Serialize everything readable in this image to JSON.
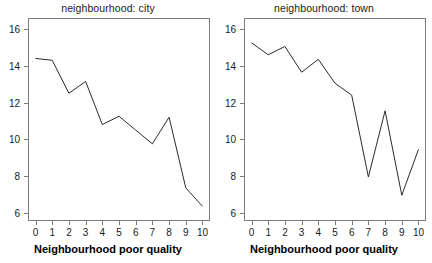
{
  "chart_data": [
    {
      "type": "line",
      "title": "neighbourhood: city",
      "xlabel": "Neighbourhood poor quality",
      "ylabel": "",
      "x": [
        0,
        1,
        2,
        3,
        4,
        5,
        6,
        7,
        8,
        9,
        10
      ],
      "xticklabels": [
        "0",
        "1",
        "2",
        "3",
        "4",
        "5",
        "6",
        "7",
        "8",
        "9",
        "10"
      ],
      "yticks": [
        6,
        8,
        10,
        12,
        14,
        16
      ],
      "yticklabels": [
        "6",
        "8",
        "10",
        "12",
        "14",
        "16"
      ],
      "values": [
        14.4,
        14.3,
        12.5,
        13.15,
        10.8,
        11.25,
        10.5,
        9.75,
        11.2,
        7.35,
        6.35
      ],
      "xlim": [
        -0.45,
        10.45
      ],
      "ylim": [
        5.55,
        16.6
      ],
      "grid": false,
      "legend": "none",
      "line_color": "#2b2b2b"
    },
    {
      "type": "line",
      "title": "neighbourhood: town",
      "xlabel": "Neighbourhood poor quality",
      "ylabel": "",
      "x": [
        0,
        1,
        2,
        3,
        4,
        5,
        6,
        7,
        8,
        9,
        10
      ],
      "xticklabels": [
        "0",
        "1",
        "2",
        "3",
        "4",
        "5",
        "6",
        "7",
        "8",
        "9",
        "10"
      ],
      "yticks": [
        6,
        8,
        10,
        12,
        14,
        16
      ],
      "yticklabels": [
        "6",
        "8",
        "10",
        "12",
        "14",
        "16"
      ],
      "values": [
        15.25,
        14.6,
        15.05,
        13.65,
        14.35,
        13.05,
        12.4,
        7.95,
        11.55,
        6.95,
        9.45
      ],
      "xlim": [
        -0.45,
        10.45
      ],
      "ylim": [
        5.55,
        16.6
      ],
      "grid": false,
      "legend": "none",
      "line_color": "#2b2b2b"
    }
  ],
  "figure": {
    "background": "#ffffff",
    "panel_count": 2,
    "frame_color": "#7a7a7a",
    "text_color": "#1a1a1a"
  }
}
